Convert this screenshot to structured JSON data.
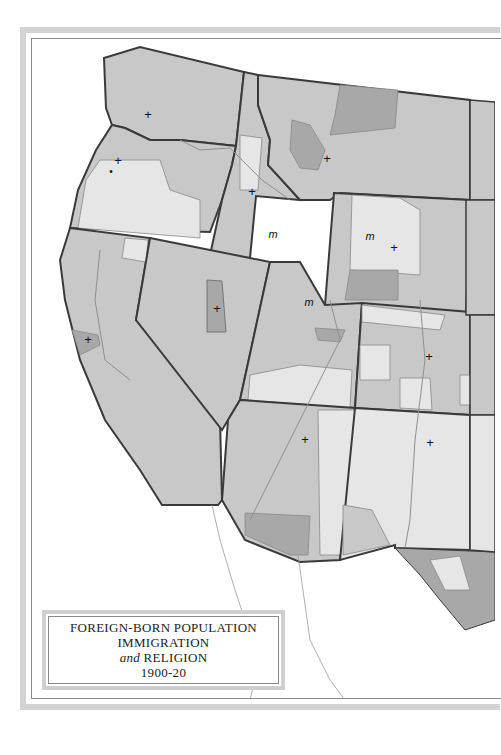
{
  "map": {
    "title_lines": [
      "FOREIGN-BORN POPULATION",
      "IMMIGRATION"
    ],
    "title_and_word": "and",
    "title_religion": "RELIGION",
    "title_years": "1900-20",
    "colors": {
      "background": "#ffffff",
      "frame": "#d3d3d3",
      "state_fill_medium": "#c8c8c8",
      "state_fill_light": "#e6e6e6",
      "state_fill_dark": "#a8a8a8",
      "state_border": "#3a3a3a",
      "river": "#8f8f8f"
    },
    "symbols": {
      "cross": "+",
      "mormon": "m",
      "dot": "•"
    }
  }
}
